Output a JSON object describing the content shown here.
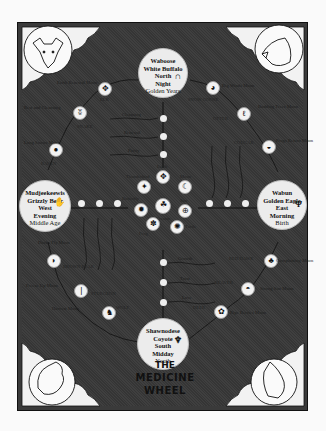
{
  "title": {
    "line1": "THE",
    "line2": "MEDICINE",
    "line3": "WHEEL"
  },
  "directions": {
    "north": {
      "line1": "Waboose",
      "line2": "White Buffalo",
      "line3": "North",
      "line4": "Night",
      "line5": "Golden Years",
      "glyph": "∩"
    },
    "east": {
      "line1": "Wabun",
      "line2": "Golden Eagle",
      "line3": "East",
      "line4": "Morning",
      "line5": "Birth",
      "glyph": "Ψ"
    },
    "south": {
      "line1": "Shawnodese",
      "line2": "Coyote",
      "line3": "South",
      "line4": "Midday",
      "line5": "Youth",
      "glyph": "♆"
    },
    "west": {
      "line1": "Mudjeekeewis",
      "line2": "Grizzly Bear",
      "line3": "West",
      "line4": "Evening",
      "line5": "Middle Age",
      "glyph": "✋"
    }
  },
  "clan_nodes": {
    "elk": {
      "label": "ELK",
      "glyph": "✥"
    },
    "snake": {
      "label": "SNAKE",
      "glyph": "ʬ"
    },
    "raven": {
      "label": "RAVEN",
      "glyph": "●"
    },
    "snow_goose": {
      "label": "SNOW GOOSE",
      "glyph": "◕"
    },
    "otter": {
      "label": "OTTER",
      "glyph": "ℓ"
    },
    "cougar": {
      "label": "COUGAR",
      "glyph": "◒"
    },
    "brown_bear": {
      "label": "BROWN BEAR",
      "glyph": "◗"
    },
    "sturgeon": {
      "label": "STURGEON",
      "glyph": "❘"
    },
    "wolf": {
      "label": "WOLF",
      "glyph": "♞"
    },
    "red_hawk": {
      "label": "RED HAWK",
      "glyph": "♣"
    },
    "beaver": {
      "label": "BEAVER",
      "glyph": "◓"
    },
    "deer": {
      "label": "DEER",
      "glyph": "✿"
    }
  },
  "center_nodes": {
    "earth": {
      "label": "Earth",
      "glyph": "✥"
    },
    "moon": {
      "label": "Moon",
      "glyph": "☾"
    },
    "thunderbird": {
      "label": "Thunderbird",
      "glyph": "✦"
    },
    "creator": {
      "label": "Creator",
      "glyph": "☘"
    },
    "sun": {
      "label": "Sun",
      "glyph": "⊕"
    },
    "frog": {
      "label": "Frog",
      "glyph": "✽"
    },
    "turtle": {
      "label": "Turtle",
      "glyph": "✺"
    },
    "butterfly": {
      "label": "Butterfly",
      "glyph": "✹"
    }
  },
  "moon_labels": {
    "nw1": "Earth Renewal Moon",
    "nw2": "Rest and Cleansing",
    "ne1": "Big Winds Moon",
    "ne2": "Budding Trees Moon",
    "ne3": "Frogs Return Moon",
    "e1": "Cornplanting Moon",
    "se1": "Strong Sun Moon",
    "se2": "Ripe Berries Moon",
    "s1": "Harvest Moon",
    "sw1": "Ducks Fly Moon",
    "sw2": "Freeze Up Moon",
    "w1": "Long Snows Moon"
  },
  "spirit_path_labels": {
    "north": [
      "Cleansing",
      "Renewal",
      "Purity"
    ],
    "east": [
      "Clarity",
      "Wisdom",
      "Illumination"
    ],
    "south": [
      "Growth",
      "Trust",
      "Love"
    ],
    "west": [
      "Experience",
      "Introspection",
      "Strength"
    ]
  },
  "corner_animals": {
    "top_left": "buffalo",
    "top_right": "eagle",
    "bottom_left": "bear-wolf",
    "bottom_right": "coyote"
  },
  "colors": {
    "background": "#3a3a3a",
    "circle_fill": "#ececec",
    "page": "#fafafa"
  }
}
